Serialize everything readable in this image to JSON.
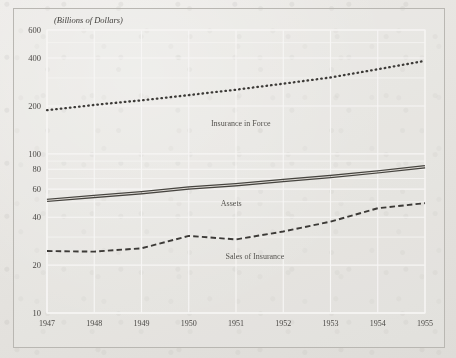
{
  "figure": {
    "unit_note": "(Billions of Dollars)",
    "background_color": "#e6e4e0",
    "ink_color": "#4a4845",
    "grid_color": "#f4f3f1"
  },
  "chart_data": {
    "type": "line",
    "title": "(Billions of Dollars)",
    "xlabel": "",
    "ylabel": "(Billions of Dollars)",
    "yscale": "log",
    "ylim": [
      10,
      600
    ],
    "ytick_labels": [
      "600",
      "400",
      "200",
      "100",
      "80",
      "60",
      "40",
      "20",
      "10"
    ],
    "ytick_values": [
      600,
      400,
      200,
      100,
      80,
      60,
      40,
      20,
      10
    ],
    "xlim": [
      1947,
      1955
    ],
    "xtick_labels": [
      "1947",
      "1948",
      "1949",
      "1950",
      "1951",
      "1952",
      "1953",
      "1954",
      "1955"
    ],
    "x": [
      1947,
      1948,
      1949,
      1950,
      1951,
      1952,
      1953,
      1954,
      1955
    ],
    "grid": true,
    "legend": "inline-labels",
    "series": [
      {
        "name": "Insurance in Force",
        "style": "dotted",
        "label_x": 1951.1,
        "label_y": 150,
        "values": [
          188,
          203,
          217,
          234,
          253,
          276,
          302,
          340,
          384
        ]
      },
      {
        "name": "Assets",
        "style": "double-solid",
        "label_x": 1950.9,
        "label_y": 47,
        "values": [
          51,
          54,
          57,
          61,
          64,
          68,
          72,
          77,
          83
        ]
      },
      {
        "name": "Sales of Insurance",
        "style": "dashed",
        "label_x": 1951.4,
        "label_y": 22,
        "values": [
          24.5,
          24.3,
          25.5,
          30.5,
          29.0,
          32.5,
          37.5,
          45.5,
          49.0
        ]
      }
    ]
  }
}
